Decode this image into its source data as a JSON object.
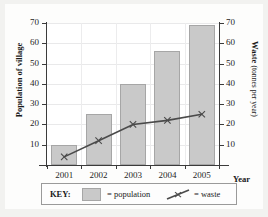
{
  "chart_data": {
    "type": "bar",
    "title": "",
    "xlabel": "Year",
    "ylabel": "Population of village",
    "ylabel_right_main": "Waste",
    "ylabel_right_sub": "(tonnes per year)",
    "categories": [
      "2001",
      "2002",
      "2003",
      "2004",
      "2005"
    ],
    "ylim": [
      0,
      70
    ],
    "yticks": [
      70,
      60,
      50,
      40,
      30,
      20,
      10
    ],
    "ylim_right": [
      0,
      70
    ],
    "yticks_right": [
      70,
      60,
      50,
      40,
      30,
      20,
      10
    ],
    "grid": true,
    "legend_position": "bottom",
    "series": [
      {
        "name": "population",
        "type": "bar",
        "axis": "left",
        "values": [
          10,
          25,
          40,
          56,
          69
        ],
        "color": "#c9c9c9"
      },
      {
        "name": "waste",
        "type": "line",
        "axis": "right",
        "values": [
          4,
          12,
          20,
          22,
          25
        ],
        "color": "#4a4a4a"
      }
    ]
  },
  "key": {
    "title": "KEY:",
    "population_label": "= population",
    "waste_label": "= waste"
  }
}
